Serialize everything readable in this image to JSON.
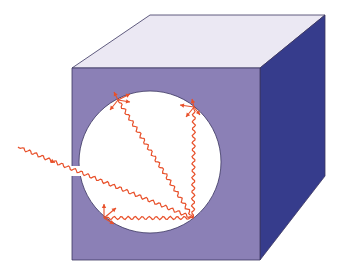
{
  "title": "Blackbody cavity: radiation entering a small aperture and reflecting inside a spherical cavity",
  "colors": {
    "background": "#ffffff",
    "front_face": "#8b80b6",
    "top_face": "#ebe8f3",
    "right_face": "#363c8c",
    "edge": "#3a3560",
    "cavity": "#ffffff",
    "ray": "#e8502a"
  },
  "cube": {
    "front": [
      [
        72,
        68
      ],
      [
        260,
        68
      ],
      [
        260,
        260
      ],
      [
        72,
        260
      ]
    ],
    "top": [
      [
        72,
        68
      ],
      [
        150,
        15
      ],
      [
        325,
        15
      ],
      [
        260,
        68
      ]
    ],
    "right": [
      [
        260,
        68
      ],
      [
        325,
        15
      ],
      [
        325,
        176
      ],
      [
        260,
        260
      ]
    ]
  },
  "cavity": {
    "cx": 150,
    "cy": 162,
    "r": 71
  },
  "aperture": {
    "x": 72,
    "y": 166,
    "width": 8,
    "height": 10
  },
  "rays": [
    {
      "name": "incoming-ray",
      "from": [
        18,
        147
      ],
      "to": [
        193,
        218
      ],
      "arrow_at": [
        54,
        162
      ]
    },
    {
      "name": "ray-to-top-left",
      "from": [
        193,
        218
      ],
      "to": [
        118,
        100
      ]
    },
    {
      "name": "ray-to-top-right",
      "from": [
        193,
        218
      ],
      "to": [
        194,
        107
      ]
    },
    {
      "name": "ray-to-bottom-left",
      "from": [
        193,
        218
      ],
      "to": [
        104,
        218
      ]
    }
  ],
  "scatter_points": [
    {
      "name": "scatter-top-left",
      "at": [
        118,
        100
      ],
      "dirs": [
        [
          -8,
          10
        ],
        [
          12,
          -6
        ],
        [
          12,
          2
        ],
        [
          -4,
          -8
        ]
      ]
    },
    {
      "name": "scatter-top-right",
      "at": [
        194,
        107
      ],
      "dirs": [
        [
          -14,
          -2
        ],
        [
          -8,
          10
        ],
        [
          6,
          8
        ],
        [
          -2,
          -8
        ]
      ]
    },
    {
      "name": "scatter-bottom-left",
      "at": [
        104,
        218
      ],
      "dirs": [
        [
          0,
          -14
        ],
        [
          12,
          -10
        ],
        [
          10,
          6
        ]
      ]
    }
  ]
}
